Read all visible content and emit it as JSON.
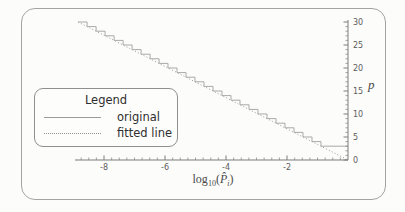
{
  "legend": {
    "title": "Legend",
    "items": [
      {
        "label": "original",
        "style": "solid"
      },
      {
        "label": "fitted line",
        "style": "dotted"
      }
    ]
  },
  "chart_data": {
    "type": "line",
    "title": "",
    "xlabel": "log10(P̂_i)",
    "ylabel": "p",
    "xlabel_parts": {
      "func": "log",
      "base": "10",
      "open_paren": "(",
      "variable": "P̂",
      "var_subscript": "i",
      "close_paren": ")"
    },
    "xlim": [
      -8.95,
      0
    ],
    "ylim": [
      0,
      30.4
    ],
    "x_major_ticks": [
      -8,
      -6,
      -4,
      -2
    ],
    "x_minor_step": 0.25,
    "y_major_ticks": [
      0,
      5,
      10,
      15,
      20,
      25,
      30
    ],
    "y_minor_step": 1,
    "y_axis_side": "right",
    "grid": false,
    "legend_position": "middle-left",
    "series": [
      {
        "name": "original",
        "type": "staircase",
        "style": "solid",
        "p_top": 30,
        "p_flat": 3,
        "x_flat_end": 0,
        "description": "integer staircase stepping down by 1 in p along the fitted line, flattening at p=3 until x=0"
      },
      {
        "name": "fitted line",
        "type": "line",
        "style": "dotted",
        "points": [
          [
            -8.85,
            30
          ],
          [
            0,
            0
          ]
        ]
      }
    ]
  }
}
